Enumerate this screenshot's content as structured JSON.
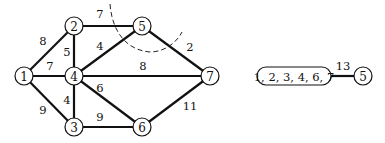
{
  "graph": {
    "nodes": [
      {
        "id": "1",
        "label": "1",
        "x": 24,
        "y": 76
      },
      {
        "id": "2",
        "label": "2",
        "x": 74,
        "y": 26
      },
      {
        "id": "3",
        "label": "3",
        "x": 74,
        "y": 127
      },
      {
        "id": "4",
        "label": "4",
        "x": 74,
        "y": 76
      },
      {
        "id": "5",
        "label": "5",
        "x": 142,
        "y": 26
      },
      {
        "id": "6",
        "label": "6",
        "x": 142,
        "y": 127
      },
      {
        "id": "7",
        "label": "7",
        "x": 210,
        "y": 76
      }
    ],
    "edges": [
      {
        "from": "1",
        "to": "2",
        "weight": "8",
        "lx": 43,
        "ly": 45
      },
      {
        "from": "1",
        "to": "4",
        "weight": "7",
        "lx": 50,
        "ly": 70
      },
      {
        "from": "1",
        "to": "3",
        "weight": "9",
        "lx": 43,
        "ly": 114
      },
      {
        "from": "2",
        "to": "4",
        "weight": "5",
        "lx": 67,
        "ly": 56
      },
      {
        "from": "2",
        "to": "5",
        "weight": "7",
        "lx": 100,
        "ly": 18
      },
      {
        "from": "4",
        "to": "5",
        "weight": "4",
        "lx": 100,
        "ly": 50
      },
      {
        "from": "4",
        "to": "7",
        "weight": "8",
        "lx": 143,
        "ly": 70
      },
      {
        "from": "4",
        "to": "6",
        "weight": "6",
        "lx": 100,
        "ly": 92
      },
      {
        "from": "4",
        "to": "3",
        "weight": "4",
        "lx": 67,
        "ly": 104
      },
      {
        "from": "3",
        "to": "6",
        "weight": "9",
        "lx": 100,
        "ly": 121
      },
      {
        "from": "5",
        "to": "7",
        "weight": "2",
        "lx": 190,
        "ly": 51
      },
      {
        "from": "6",
        "to": "7",
        "weight": "11",
        "lx": 190,
        "ly": 110
      }
    ],
    "cut_line": "dashed"
  },
  "contracted": {
    "group_label": "1, 2, 3, 4, 6, 7",
    "node_label": "5",
    "edge_weight": "13"
  }
}
